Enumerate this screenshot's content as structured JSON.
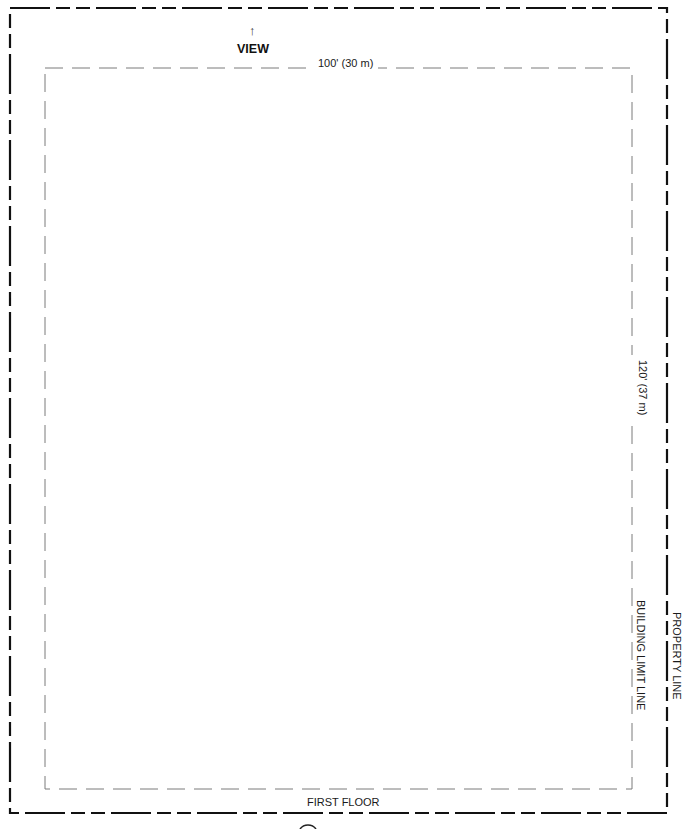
{
  "drawing": {
    "view_arrow": "↑",
    "view_label": "VIEW",
    "width_dimension": "100' (30 m)",
    "depth_dimension": "120' (37 m)",
    "building_limit_label": "BUILDING LIMIT LINE",
    "property_line_label": "PROPERTY LINE",
    "floor_label": "FIRST FLOOR"
  },
  "colors": {
    "property_line": "#111111",
    "building_limit_line": "#777777",
    "text": "#1a1a1a"
  }
}
